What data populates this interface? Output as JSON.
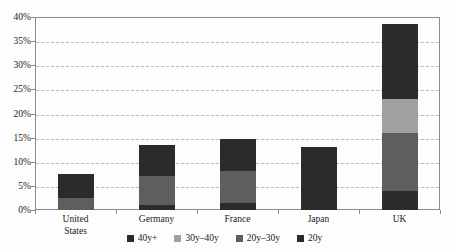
{
  "chart_data": {
    "type": "bar",
    "stacked": true,
    "title": "",
    "xlabel": "",
    "ylabel": "",
    "ylim": [
      0,
      40
    ],
    "ytick_values": [
      0,
      5,
      10,
      15,
      20,
      25,
      30,
      35,
      40
    ],
    "ytick_labels": [
      "0%",
      "5%",
      "10%",
      "15%",
      "20%",
      "25%",
      "30%",
      "35%",
      "40%"
    ],
    "grid": true,
    "grid_style": "dashed horizontal",
    "legend_position": "bottom",
    "categories": [
      "United States",
      "Germany",
      "France",
      "Japan",
      "UK"
    ],
    "category_label_lines": [
      [
        "United",
        "States"
      ],
      [
        "Germany"
      ],
      [
        "France"
      ],
      [
        "Japan"
      ],
      [
        "UK"
      ]
    ],
    "series": [
      {
        "name": "20y",
        "color": "#2b2b2b",
        "values": [
          0,
          1.0,
          1.5,
          1.5,
          4.0
        ]
      },
      {
        "name": "20y-30y",
        "color": "#5e5e5e",
        "values": [
          2.5,
          6.0,
          6.5,
          0,
          12.0
        ]
      },
      {
        "name": "30y-40y",
        "color": "#a0a0a0",
        "values": [
          0,
          0,
          0,
          0,
          7.0
        ]
      },
      {
        "name": "40y+",
        "color": "#2b2b2b",
        "values": [
          5.0,
          6.5,
          6.8,
          11.5,
          15.5
        ]
      }
    ],
    "totals": [
      7.5,
      13.5,
      14.8,
      13.0,
      38.5
    ]
  },
  "legend": {
    "items": [
      {
        "label": "40y+",
        "color": "#2b2b2b"
      },
      {
        "label": "30y–40y",
        "color": "#a0a0a0"
      },
      {
        "label": "20y–30y",
        "color": "#5e5e5e"
      },
      {
        "label": "20y",
        "color": "#2b2b2b"
      }
    ]
  },
  "style": {
    "background": "#fdfdfd",
    "frame_color": "#8a8a90",
    "grid_color": "#b9b9c4",
    "text_color": "#1a1a1a"
  }
}
